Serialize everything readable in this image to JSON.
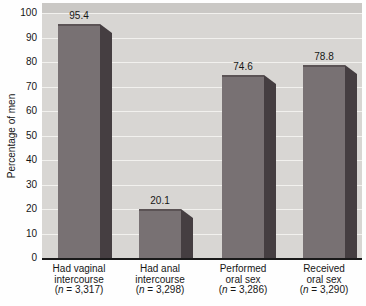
{
  "colors": {
    "page_bg": "#fefefe",
    "plot_bg": "#d8d6d3",
    "top_band": "#cac8c5",
    "grid": "#f2f1ee",
    "bar_front": "#787173",
    "bar_side": "#453e41",
    "bar_edge": "#5b5355",
    "axis": "#1a1a1a",
    "text": "#161616"
  },
  "chart_data": {
    "type": "bar",
    "title": "",
    "xlabel": "",
    "ylabel": "Percentage of men",
    "ylim": [
      0,
      100
    ],
    "yticks": [
      0,
      10,
      20,
      30,
      40,
      50,
      60,
      70,
      80,
      90,
      100
    ],
    "grid": "horizontal white gridlines every 10 units",
    "legend": "none",
    "style": "3D-extruded gray bars on light gray panel, data labels above bars",
    "categories": [
      "Had vaginal intercourse (n = 3,317)",
      "Had anal intercourse (n = 3,298)",
      "Performed oral sex (n = 3,286)",
      "Received oral sex (n = 3,290)"
    ],
    "values": [
      95.4,
      20.1,
      74.6,
      78.8
    ],
    "value_labels": [
      "95.4",
      "20.1",
      "74.6",
      "78.8"
    ],
    "categories_display": [
      {
        "line1": "Had vaginal",
        "line2": "intercourse",
        "n_open": "(",
        "n_symbol": "n",
        "n_eq": " = ",
        "n_value": "3,317",
        "n_close": ")"
      },
      {
        "line1": "Had anal",
        "line2": "intercourse",
        "n_open": "(",
        "n_symbol": "n",
        "n_eq": " = ",
        "n_value": "3,298",
        "n_close": ")"
      },
      {
        "line1": "Performed",
        "line2": "oral sex",
        "n_open": "(",
        "n_symbol": "n",
        "n_eq": " = ",
        "n_value": "3,286",
        "n_close": ")"
      },
      {
        "line1": "Received",
        "line2": "oral sex",
        "n_open": "(",
        "n_symbol": "n",
        "n_eq": " = ",
        "n_value": "3,290",
        "n_close": ")"
      }
    ]
  }
}
